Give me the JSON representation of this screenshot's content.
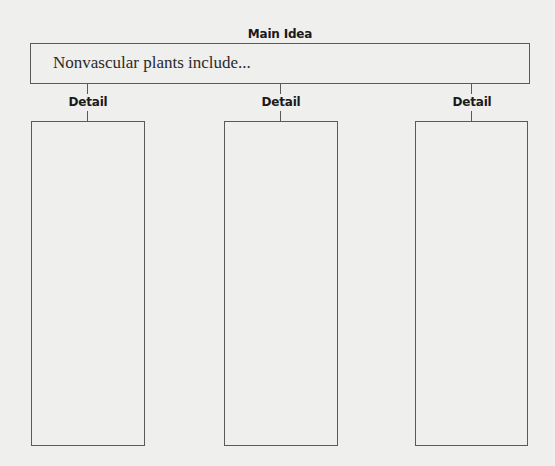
{
  "organizer": {
    "main_label": "Main Idea",
    "main_text": "Nonvascular plants include...",
    "details": [
      {
        "label": "Detail",
        "content": ""
      },
      {
        "label": "Detail",
        "content": ""
      },
      {
        "label": "Detail",
        "content": ""
      }
    ]
  }
}
